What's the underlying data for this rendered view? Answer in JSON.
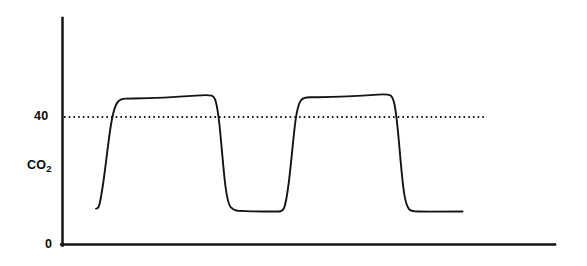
{
  "figure": {
    "background_color": "#ffffff",
    "ink_color": "#141414",
    "width": 587,
    "height": 266
  },
  "axes": {
    "y_axis": {
      "name": "y-axis",
      "x": 62,
      "y_top": 18,
      "y_bottom": 245,
      "color": "#141414",
      "width": 2.4
    },
    "x_axis": {
      "name": "x-axis",
      "y": 245,
      "x_left": 62,
      "x_right": 555,
      "color": "#141414",
      "width": 2.4
    },
    "y_tick_labels": [
      "40",
      "0"
    ],
    "y_axis_title": "CO",
    "y_axis_title_subscript": "2",
    "zero_label": "0"
  },
  "reference_line": {
    "label": "40",
    "value": 40,
    "y_pixel": 117,
    "x_start": 64,
    "x_end": 486,
    "style": "dotted",
    "color": "#1a1a1a",
    "dash": "1.6 3.1",
    "width": 2.0
  },
  "chart_data": {
    "type": "line",
    "title": "",
    "subtitle": "",
    "xlabel": "",
    "ylabel": "CO2",
    "legend": [],
    "legend_position": "none",
    "grid": false,
    "ylim": [
      0,
      60
    ],
    "xlim": [
      0,
      100
    ],
    "yticks": [
      0,
      40
    ],
    "ytick_labels": [
      "0",
      "40"
    ],
    "xticks": [],
    "xtick_labels": [],
    "annotations": [
      {
        "text": "40",
        "type": "y-tick",
        "value": 40
      },
      {
        "text": "CO2",
        "type": "y-axis-title"
      },
      {
        "text": "0",
        "type": "origin"
      }
    ],
    "series": [
      {
        "name": "CO2 waveform",
        "color": "#141414",
        "line_width": 1.9,
        "description": "Capnogram trace: two full expiratory waveforms with rapid upstroke, slightly rising alveolar plateau above the 40 reference line, and rapid downstroke to a low inspiratory baseline.",
        "baseline_value": 12,
        "plateau_start_value": 45,
        "plateau_end_value": 47,
        "cycles": 2,
        "x": [
          7.0,
          7.5,
          8.0,
          8.6,
          9.2,
          9.8,
          10.6,
          11.6,
          13.2,
          15.0,
          17.0,
          19.0,
          21.5,
          24.0,
          26.5,
          29.0,
          30.5,
          31.4,
          32.2,
          33.0,
          34.0,
          35.2,
          36.6,
          38.6,
          41.0,
          43.5,
          44.4,
          45.1,
          45.8,
          46.6,
          47.6,
          49.0,
          51.0,
          54.0,
          57.0,
          60.0,
          63.0,
          66.0,
          67.4,
          68.2,
          69.0,
          69.9,
          71.0,
          72.4,
          74.4,
          77.0,
          80.0,
          83.0,
          85.5,
          87.0,
          87.9,
          88.7,
          89.5,
          90.5,
          91.8,
          93.6,
          96.0,
          99.0,
          101.0
        ],
        "y": [
          12.0,
          12.0,
          12.2,
          13.4,
          16.0,
          20.0,
          25.0,
          31.0,
          36.5,
          39.5,
          41.6,
          43.2,
          44.4,
          44.9,
          45.1,
          45.3,
          45.4,
          45.5,
          45.6,
          45.7,
          45.9,
          46.1,
          46.3,
          46.6,
          46.9,
          47.1,
          47.2,
          47.2,
          47.1,
          46.6,
          45.0,
          41.0,
          33.0,
          22.0,
          15.5,
          12.8,
          12.2,
          12.1,
          12.1,
          12.1,
          12.1,
          12.2,
          13.5,
          17.5,
          25.0,
          34.0,
          41.0,
          44.3,
          45.2,
          45.5,
          45.7,
          45.9,
          46.1,
          46.4,
          46.8,
          47.1,
          47.2,
          47.1,
          46.5
        ],
        "trace_end_value": 12
      }
    ]
  }
}
